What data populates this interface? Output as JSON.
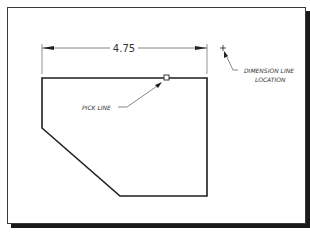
{
  "figure": {
    "dimension": {
      "value": "4.75"
    },
    "annotations": {
      "pick_line": "PICK LINE",
      "dimension_line_location_1": "DIMENSION LINE",
      "dimension_line_location_2": "LOCATION"
    },
    "colors": {
      "line": "#1e1e1e",
      "dim_line": "#555555",
      "text": "#333333",
      "shadow": "#1a1a1a"
    }
  }
}
